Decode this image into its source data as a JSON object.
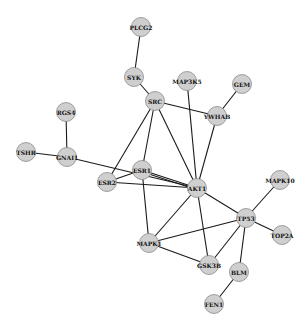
{
  "network": {
    "node_color": "#d0d0d0",
    "edge_color": "#1a1a1a",
    "nodes": [
      {
        "id": "PLCG2",
        "label": "PLCG2",
        "x": 141,
        "y": 27
      },
      {
        "id": "SYK",
        "label": "SYK",
        "x": 134,
        "y": 77
      },
      {
        "id": "SRC",
        "label": "SRC",
        "x": 155,
        "y": 101
      },
      {
        "id": "MAP3K5",
        "label": "MAP3K5",
        "x": 187,
        "y": 81
      },
      {
        "id": "GEM",
        "label": "GEM",
        "x": 242,
        "y": 84
      },
      {
        "id": "YWHAB",
        "label": "YWHAB",
        "x": 217,
        "y": 116
      },
      {
        "id": "RGS4",
        "label": "RGS4",
        "x": 66,
        "y": 112
      },
      {
        "id": "TSHR",
        "label": "TSHR",
        "x": 26,
        "y": 152
      },
      {
        "id": "GNAI1",
        "label": "GNAI1",
        "x": 67,
        "y": 157
      },
      {
        "id": "ESR1",
        "label": "ESR1",
        "x": 142,
        "y": 170
      },
      {
        "id": "ESR2",
        "label": "ESR2",
        "x": 107,
        "y": 182
      },
      {
        "id": "AKT1",
        "label": "AKT1",
        "x": 197,
        "y": 188
      },
      {
        "id": "MAPK10",
        "label": "MAPK10",
        "x": 280,
        "y": 180
      },
      {
        "id": "TP53",
        "label": "TP53",
        "x": 246,
        "y": 218
      },
      {
        "id": "TOP2A",
        "label": "TOP2A",
        "x": 282,
        "y": 235
      },
      {
        "id": "MAPK1",
        "label": "MAPK1",
        "x": 149,
        "y": 243
      },
      {
        "id": "GSK3B",
        "label": "GSK3B",
        "x": 209,
        "y": 265
      },
      {
        "id": "BLM",
        "label": "BLM",
        "x": 239,
        "y": 272
      },
      {
        "id": "FEN1",
        "label": "FEN1",
        "x": 214,
        "y": 304
      }
    ],
    "edges": [
      [
        "PLCG2",
        "SYK"
      ],
      [
        "SYK",
        "SRC"
      ],
      [
        "SRC",
        "YWHAB"
      ],
      [
        "SRC",
        "ESR1"
      ],
      [
        "SRC",
        "ESR2"
      ],
      [
        "SRC",
        "AKT1"
      ],
      [
        "MAP3K5",
        "AKT1"
      ],
      [
        "GEM",
        "YWHAB"
      ],
      [
        "YWHAB",
        "AKT1"
      ],
      [
        "RGS4",
        "GNAI1"
      ],
      [
        "TSHR",
        "GNAI1"
      ],
      [
        "GNAI1",
        "AKT1"
      ],
      [
        "ESR1",
        "ESR2"
      ],
      [
        "ESR1",
        "AKT1"
      ],
      [
        "ESR1",
        "AKT1"
      ],
      [
        "ESR2",
        "AKT1"
      ],
      [
        "ESR1",
        "MAPK1"
      ],
      [
        "AKT1",
        "TP53"
      ],
      [
        "AKT1",
        "GSK3B"
      ],
      [
        "AKT1",
        "MAPK1"
      ],
      [
        "MAPK10",
        "TP53"
      ],
      [
        "TP53",
        "TOP2A"
      ],
      [
        "TP53",
        "MAPK1"
      ],
      [
        "TP53",
        "GSK3B"
      ],
      [
        "TP53",
        "BLM"
      ],
      [
        "MAPK1",
        "GSK3B"
      ],
      [
        "BLM",
        "FEN1"
      ]
    ]
  }
}
